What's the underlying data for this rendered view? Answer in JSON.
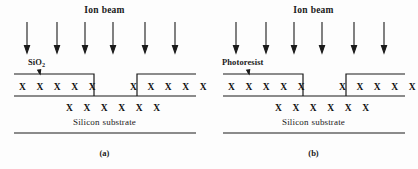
{
  "figure": {
    "background_color": "#fdfdfd",
    "line_color": "#1a1a1a",
    "panels": [
      {
        "id": "panel-a",
        "caption": "(a)",
        "beam_label_word1": "Ion",
        "beam_label_word2": "beam",
        "arrow_count": 6,
        "arrow_x_positions": [
          27,
          57,
          85,
          113,
          145,
          175
        ],
        "arrow_top": 22,
        "arrow_bottom": 52,
        "mask_label": "SiO",
        "mask_label_subscript": "2",
        "mask_label_full": "SiO2",
        "x_marks_left": "X X X X X",
        "x_marks_right": "X X X X X",
        "x_marks_middle": "X X X X X X",
        "x_count_left": 5,
        "x_count_right": 5,
        "x_count_middle": 6,
        "substrate_label_word1": "Silicon",
        "substrate_label_word2": "substrate",
        "geometry": {
          "left_edge": 14,
          "right_edge": 196,
          "oxide_top_y": 74,
          "interface_y": 96,
          "bottom_y": 133,
          "trench_left_x": 94,
          "trench_right_x": 137
        }
      },
      {
        "id": "panel-b",
        "caption": "(b)",
        "beam_label_word1": "Ion",
        "beam_label_word2": "beam",
        "arrow_count": 6,
        "arrow_x_positions": [
          27,
          57,
          85,
          113,
          145,
          175
        ],
        "arrow_top": 22,
        "arrow_bottom": 52,
        "mask_label": "Photoresist",
        "mask_label_subscript": "",
        "mask_label_full": "Photoresist",
        "x_marks_left": "X X X X X",
        "x_marks_right": "X X X X X",
        "x_marks_middle": "X X X X X X",
        "x_count_left": 5,
        "x_count_right": 5,
        "x_count_middle": 6,
        "substrate_label_word1": "Silicon",
        "substrate_label_word2": "substrate",
        "geometry": {
          "left_edge": 14,
          "right_edge": 196,
          "oxide_top_y": 74,
          "interface_y": 96,
          "bottom_y": 133,
          "trench_left_x": 94,
          "trench_right_x": 137
        }
      }
    ]
  }
}
